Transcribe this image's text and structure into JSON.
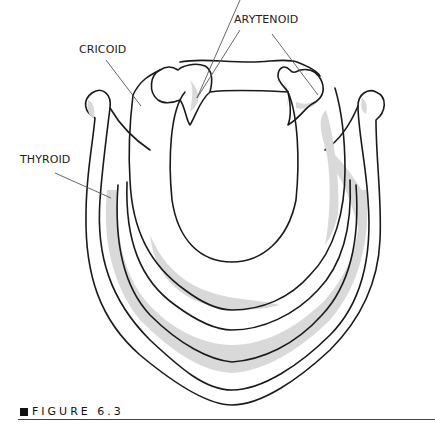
{
  "figure": {
    "caption": "FIGURE 6.3",
    "labels": {
      "arytenoid": "ARYTENOID",
      "cricoid": "CRICOID",
      "thyroid": "THYROID"
    },
    "colors": {
      "outline": "#1a1a1a",
      "shading": "#d9d9d9",
      "leader": "#555555",
      "background": "#ffffff"
    }
  }
}
